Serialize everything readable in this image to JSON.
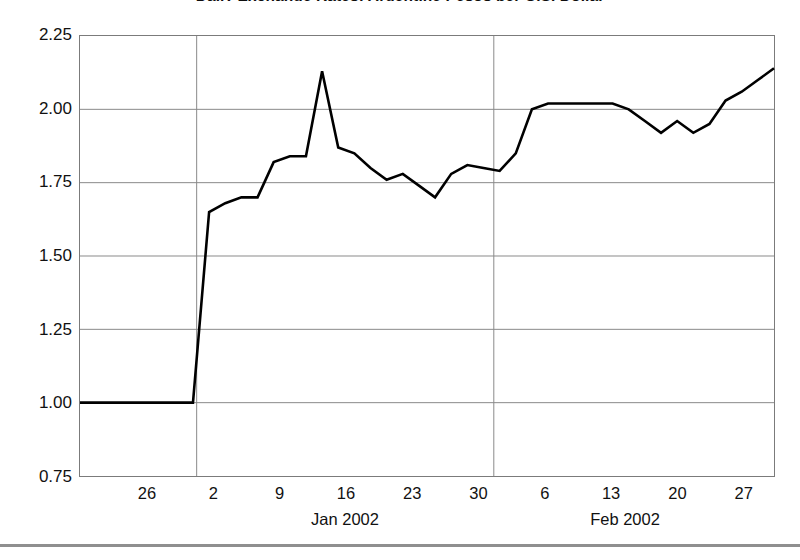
{
  "chart_data": {
    "type": "line",
    "title": "Daily Exchange Rates: Argentine Pesos per U.S. Dollar",
    "xlabel": "",
    "ylabel": "",
    "ylim": [
      0.75,
      2.25
    ],
    "ytick_labels": [
      "2.25",
      "2.00",
      "1.75",
      "1.50",
      "1.25",
      "1.00",
      "0.75"
    ],
    "ytick_values": [
      2.25,
      2.0,
      1.75,
      1.5,
      1.25,
      1.0,
      0.75
    ],
    "xtick_labels": [
      "26",
      "2",
      "9",
      "16",
      "23",
      "30",
      "6",
      "13",
      "20",
      "27"
    ],
    "x_group_labels": [
      "Jan 2002",
      "Feb 2002"
    ],
    "grid": "horizontal-and-month-dividers",
    "legend": "none",
    "line_color": "#000000",
    "series": [
      {
        "name": "Argentine Pesos per U.S. Dollar",
        "x": [
          "Dec 24",
          "Dec 26",
          "Dec 28",
          "Dec 31",
          "Jan 2",
          "Jan 4",
          "Jan 7",
          "Jan 9",
          "Jan 10",
          "Jan 11",
          "Jan 14",
          "Jan 15",
          "Jan 16",
          "Jan 17",
          "Jan 18",
          "Jan 21",
          "Jan 22",
          "Jan 23",
          "Jan 24",
          "Jan 25",
          "Jan 28",
          "Jan 29",
          "Jan 30",
          "Jan 31",
          "Feb 1",
          "Feb 4",
          "Feb 5",
          "Feb 6",
          "Feb 7",
          "Feb 8",
          "Feb 11",
          "Feb 12",
          "Feb 13",
          "Feb 14",
          "Feb 15",
          "Feb 18",
          "Feb 19",
          "Feb 20",
          "Feb 21",
          "Feb 22",
          "Feb 25",
          "Feb 26",
          "Feb 27",
          "Feb 28"
        ],
        "values": [
          1.0,
          1.0,
          1.0,
          1.0,
          1.0,
          1.0,
          1.0,
          1.0,
          1.65,
          1.68,
          1.7,
          1.7,
          1.82,
          1.84,
          1.84,
          2.13,
          1.87,
          1.85,
          1.8,
          1.76,
          1.78,
          1.74,
          1.7,
          1.78,
          1.81,
          1.8,
          1.79,
          1.85,
          2.0,
          2.02,
          2.02,
          2.02,
          2.02,
          2.02,
          2.0,
          1.96,
          1.92,
          1.96,
          1.92,
          1.95,
          2.03,
          2.06,
          2.1,
          2.14
        ]
      }
    ],
    "annotations": [
      {
        "label": "pre-devaluation peg",
        "value": 1.0
      },
      {
        "label": "spike peak",
        "value": 2.13
      },
      {
        "label": "plateau",
        "value": 2.02
      },
      {
        "label": "final value",
        "value": 2.2
      }
    ]
  },
  "footer": {
    "rule": ""
  }
}
